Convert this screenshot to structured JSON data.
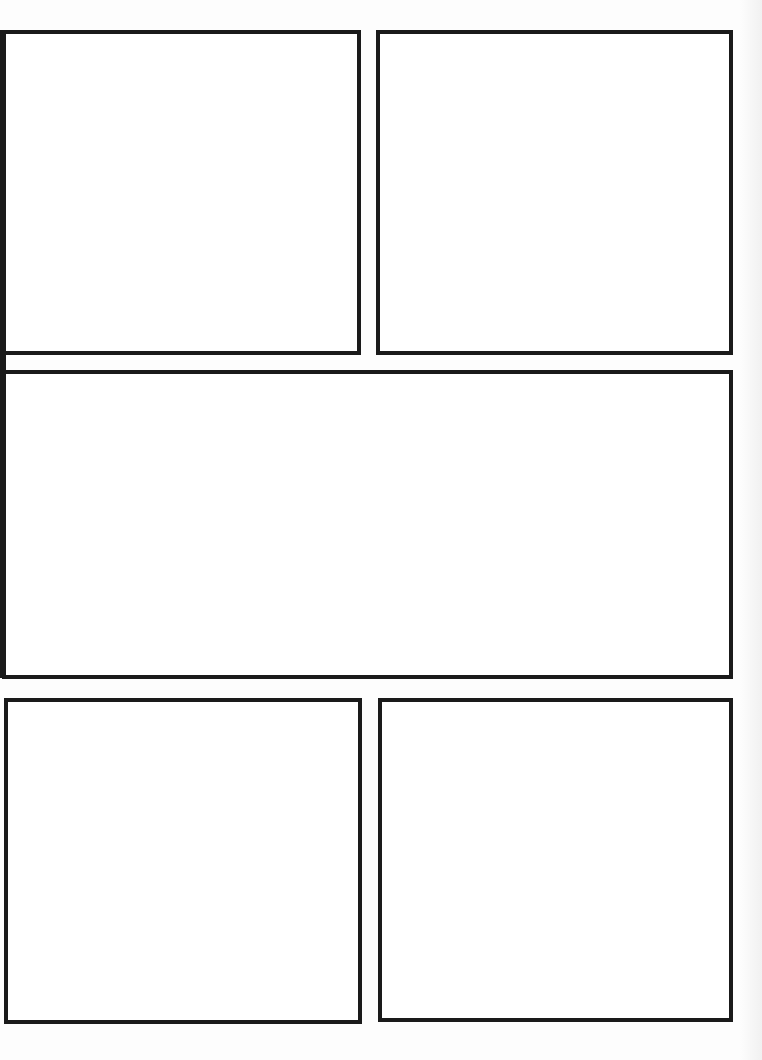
{
  "page": {
    "type": "comic-page-template",
    "panel_count": 5,
    "panels": [
      {
        "id": "panel-1",
        "row": 1,
        "label": ""
      },
      {
        "id": "panel-2",
        "row": 1,
        "label": ""
      },
      {
        "id": "panel-3",
        "row": 2,
        "label": ""
      },
      {
        "id": "panel-4",
        "row": 3,
        "label": ""
      },
      {
        "id": "panel-5",
        "row": 3,
        "label": ""
      }
    ],
    "colors": {
      "border": "#1a1a1a",
      "background": "#ffffff"
    }
  }
}
